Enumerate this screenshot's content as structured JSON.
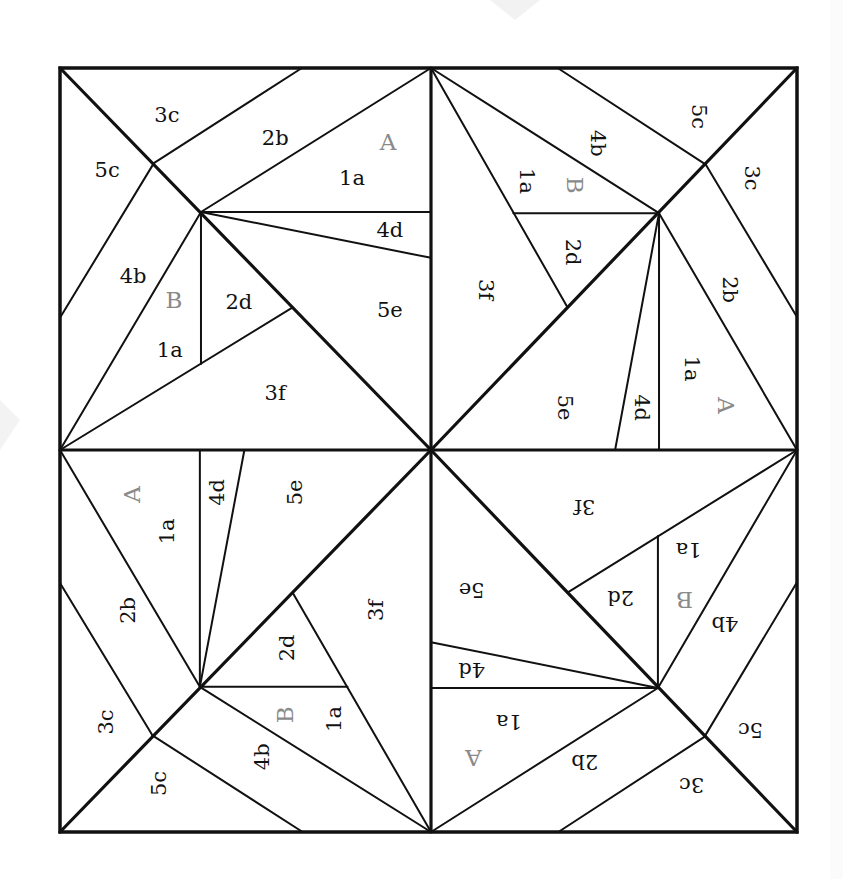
{
  "colors": {
    "line": "#111111",
    "label": "#111111",
    "section_label": "#8a8a8a",
    "background": "#ffffff"
  },
  "block": {
    "left": 60,
    "top": 68,
    "right": 797,
    "bottom": 832,
    "center": [
      431,
      450
    ]
  },
  "quadrants": [
    {
      "name": "top-left",
      "rotation_deg": 0
    },
    {
      "name": "top-right",
      "rotation_deg": 90
    },
    {
      "name": "bottom-right",
      "rotation_deg": 180
    },
    {
      "name": "bottom-left",
      "rotation_deg": 270
    }
  ],
  "unit_seams": [
    {
      "id": "diagonal",
      "from": [
        0,
        0
      ],
      "to": [
        1,
        1
      ],
      "thick": true
    },
    {
      "id": "3c-2b",
      "from": [
        0.652,
        0
      ],
      "to": [
        0.253,
        0.249
      ]
    },
    {
      "id": "2b-1a",
      "from": [
        1,
        0
      ],
      "to": [
        0.38,
        0.377
      ]
    },
    {
      "id": "1a-4d",
      "from": [
        0.38,
        0.377
      ],
      "to": [
        1,
        0.377
      ]
    },
    {
      "id": "4d-5e",
      "from": [
        0.38,
        0.377
      ],
      "to": [
        1,
        0.497
      ]
    },
    {
      "id": "5c-4b",
      "from": [
        0,
        0.654
      ],
      "to": [
        0.253,
        0.249
      ]
    },
    {
      "id": "4b-1a",
      "from": [
        0.38,
        0.377
      ],
      "to": [
        0,
        1
      ]
    },
    {
      "id": "1a-2d",
      "from": [
        0.38,
        0.377
      ],
      "to": [
        0.38,
        0.775
      ]
    },
    {
      "id": "3f-edge",
      "from": [
        0,
        1
      ],
      "to": [
        0.625,
        0.628
      ]
    }
  ],
  "unit_labels": [
    {
      "text": "3c",
      "at": [
        0.288,
        0.123
      ],
      "section": false
    },
    {
      "text": "2b",
      "at": [
        0.58,
        0.183
      ],
      "section": false
    },
    {
      "text": "A",
      "at": [
        0.884,
        0.195
      ],
      "section": true
    },
    {
      "text": "1a",
      "at": [
        0.787,
        0.288
      ],
      "section": false
    },
    {
      "text": "5c",
      "at": [
        0.127,
        0.267
      ],
      "section": false
    },
    {
      "text": "4d",
      "at": [
        0.889,
        0.424
      ],
      "section": false
    },
    {
      "text": "4b",
      "at": [
        0.197,
        0.545
      ],
      "section": false
    },
    {
      "text": "B",
      "at": [
        0.307,
        0.607
      ],
      "section": true
    },
    {
      "text": "2d",
      "at": [
        0.482,
        0.613
      ],
      "section": false
    },
    {
      "text": "5e",
      "at": [
        0.889,
        0.634
      ],
      "section": false
    },
    {
      "text": "1a",
      "at": [
        0.296,
        0.738
      ],
      "section": false
    },
    {
      "text": "3f",
      "at": [
        0.58,
        0.851
      ],
      "section": false
    }
  ],
  "sections": [
    "A",
    "B"
  ],
  "piece_labels": [
    "1a",
    "2b",
    "3c",
    "4d",
    "5c",
    "4b",
    "2d",
    "5e",
    "1a",
    "3f"
  ]
}
